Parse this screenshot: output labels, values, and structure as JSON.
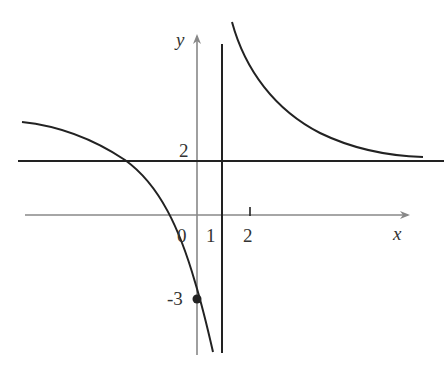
{
  "figure": {
    "type": "function-graph",
    "axes": {
      "x_label": "x",
      "y_label": "y",
      "origin_label": "0",
      "x_ticks": [
        {
          "value": 1,
          "label": "1"
        },
        {
          "value": 2,
          "label": "2"
        }
      ],
      "y_ticks": [
        {
          "value": 2,
          "label": "2"
        },
        {
          "value": -3,
          "label": "-3"
        }
      ]
    },
    "asymptotes": {
      "vertical": {
        "x": 1
      },
      "horizontal": {
        "y": 2
      }
    },
    "point": {
      "x": 0,
      "y": -3,
      "label": "-3"
    },
    "colors": {
      "axis": "#888888",
      "curve": "#222222",
      "text": "#333333"
    }
  }
}
